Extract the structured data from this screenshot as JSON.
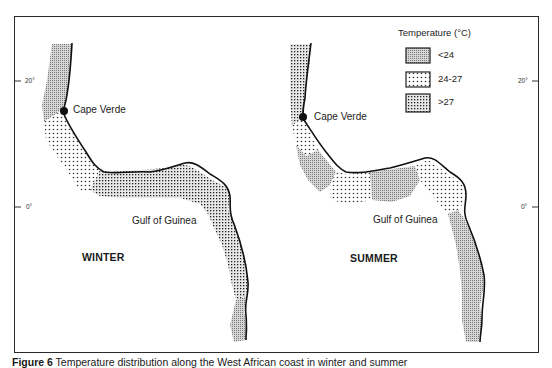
{
  "figure": {
    "caption_label": "Figure 6",
    "caption_text": "Temperature distribution along the West African coast in winter and summer",
    "frame_color": "#2a2a2a"
  },
  "legend": {
    "title": "Temperature (°C)",
    "items": [
      {
        "label": "<24",
        "pattern": "fine-hatch",
        "color": "#9a9a9a"
      },
      {
        "label": "24-27",
        "pattern": "sparse-dots",
        "color": "#555555"
      },
      {
        "label": ">27",
        "pattern": "dense-grid",
        "color": "#333333"
      }
    ]
  },
  "panels": [
    {
      "season": "WINTER",
      "places": [
        "Cape Verde",
        "Gulf of Guinea"
      ],
      "lat_ticks": [
        "20°",
        "0°"
      ],
      "zones": [
        {
          "segment": "north of Cape Verde",
          "class": "<24"
        },
        {
          "segment": "Cape Verde to Gulf bend",
          "class": "24-27"
        },
        {
          "segment": "Gulf of Guinea coast",
          "class": ">27"
        },
        {
          "segment": "southern coast",
          "class": "<24"
        }
      ]
    },
    {
      "season": "SUMMER",
      "places": [
        "Cape Verde",
        "Gulf of Guinea"
      ],
      "lat_ticks": [
        "20°",
        "0°"
      ],
      "zones": [
        {
          "segment": "north of Cape Verde",
          "class": ">27"
        },
        {
          "segment": "south of Cape Verde",
          "class": "24-27"
        },
        {
          "segment": "Gulf bend west",
          "class": "<24"
        },
        {
          "segment": "Gulf bend central",
          "class": "24-27"
        },
        {
          "segment": "Gulf bend east",
          "class": "<24"
        },
        {
          "segment": "Gulf east corner",
          "class": "24-27"
        },
        {
          "segment": "southern coast",
          "class": "<24"
        }
      ]
    }
  ],
  "axes": {
    "left_ticks": [
      {
        "label": "20°",
        "y": 81
      },
      {
        "label": "0°",
        "y": 207
      }
    ],
    "right_ticks": [
      {
        "label": "20°",
        "y": 81
      },
      {
        "label": "0°",
        "y": 207
      }
    ]
  }
}
